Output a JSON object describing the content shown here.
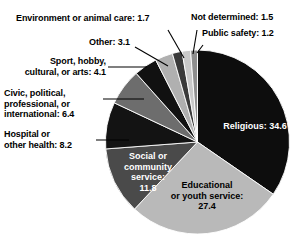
{
  "chart_data": {
    "type": "pie",
    "title": "",
    "unit": "percent",
    "total": 100.0,
    "legend_position": "callout-labels",
    "categories": [
      "Religious",
      "Educational or youth service",
      "Social or community service",
      "Hospital or other health",
      "Civic, political, professional, or international",
      "Sport, hobby, cultural, or arts",
      "Environment or animal care",
      "Other",
      "Not determined",
      "Public safety"
    ],
    "values": [
      34.6,
      27.4,
      11.8,
      8.2,
      6.4,
      4.1,
      1.7,
      3.1,
      1.5,
      1.2
    ],
    "colors": [
      "#0d0d0d",
      "#b9b9b9",
      "#4a4a4a",
      "#131313",
      "#6d6d6d",
      "#111111",
      "#3a3a3a",
      "#b0b0b0",
      "#c9c9c9",
      "#8e8e8e"
    ],
    "slices": [
      {
        "key": "religious",
        "label": "Religious: 34.6",
        "value": 34.6,
        "color": "#0d0d0d",
        "start_deg": 0.0,
        "sweep_deg": 124.56
      },
      {
        "key": "educational",
        "label": "Educational\nor youth service:\n27.4",
        "value": 27.4,
        "color": "#b9b9b9",
        "start_deg": 124.56,
        "sweep_deg": 98.64
      },
      {
        "key": "social",
        "label": "Social or\ncommunity\nservice:\n11.8",
        "value": 11.8,
        "color": "#4a4a4a",
        "start_deg": 223.2,
        "sweep_deg": 42.48
      },
      {
        "key": "hospital",
        "label": "Hospital or\nother health: 8.2",
        "value": 8.2,
        "color": "#131313",
        "start_deg": 265.68,
        "sweep_deg": 29.52
      },
      {
        "key": "civic",
        "label": "Civic, political,\nprofessional, or\ninternational: 6.4",
        "value": 6.4,
        "color": "#6d6d6d",
        "start_deg": 295.2,
        "sweep_deg": 23.04
      },
      {
        "key": "sport",
        "label": "Sport, hobby,\ncultural, or arts: 4.1",
        "value": 4.1,
        "color": "#111111",
        "start_deg": 318.24,
        "sweep_deg": 14.76
      },
      {
        "key": "other",
        "label": "Other: 3.1",
        "value": 3.1,
        "color": "#b0b0b0",
        "start_deg": 333.0,
        "sweep_deg": 11.16
      },
      {
        "key": "environment",
        "label": "Environment or animal care: 1.7",
        "value": 1.7,
        "color": "#3a3a3a",
        "start_deg": 344.16,
        "sweep_deg": 6.12
      },
      {
        "key": "notdet",
        "label": "Not determined: 1.5",
        "value": 1.5,
        "color": "#c9c9c9",
        "start_deg": 350.28,
        "sweep_deg": 5.4
      },
      {
        "key": "publicsafety",
        "label": "Public safety: 1.2",
        "value": 1.2,
        "color": "#8e8e8e",
        "start_deg": 355.68,
        "sweep_deg": 4.32
      }
    ]
  },
  "callouts": {
    "environment": "Environment or animal care: 1.7",
    "other": "Other: 3.1",
    "sport": "Sport, hobby,\ncultural, or arts: 4.1",
    "civic": "Civic, political,\nprofessional, or\ninternational: 6.4",
    "hospital": "Hospital or\nother health: 8.2",
    "not_determined": "Not determined: 1.5",
    "public_safety": "Public safety: 1.2"
  },
  "inner_labels": {
    "religious": "Religious: 34.6",
    "educational": "Educational\nor youth service:\n27.4",
    "social": "Social or\ncommunity\nservice:\n11.8"
  }
}
